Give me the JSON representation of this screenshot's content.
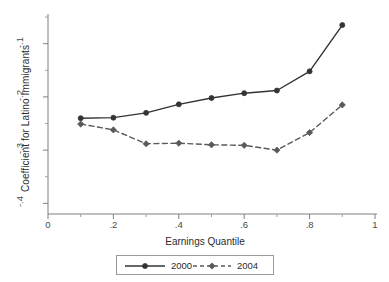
{
  "chart_data": {
    "type": "line",
    "title": "",
    "xlabel": "Earnings Quantile",
    "ylabel": "Coefficient for Latino Immigrants",
    "xlim": [
      0,
      1
    ],
    "ylim": [
      -0.42,
      -0.048
    ],
    "grid": false,
    "legend_position": "bottom-outside",
    "x": [
      0.1,
      0.2,
      0.3,
      0.4,
      0.5,
      0.6,
      0.7,
      0.8,
      0.9
    ],
    "xticks": [
      "0",
      ".2",
      ".4",
      ".6",
      ".8",
      "1"
    ],
    "xtick_values": [
      0,
      0.2,
      0.4,
      0.6,
      0.8,
      1
    ],
    "xminor_values": [
      0.1,
      0.3,
      0.5,
      0.7,
      0.9
    ],
    "yticks": [
      "-.1",
      "-.2",
      "-.3",
      "-.4"
    ],
    "ytick_values": [
      -0.1,
      -0.2,
      -0.3,
      -0.4
    ],
    "series": [
      {
        "name": "2000",
        "linestyle": "solid",
        "marker": "circle",
        "color": "#333333",
        "values": [
          -0.24,
          -0.239,
          -0.23,
          -0.214,
          -0.202,
          -0.193,
          -0.188,
          -0.152,
          -0.065
        ]
      },
      {
        "name": "2004",
        "linestyle": "dashed",
        "marker": "diamond",
        "color": "#5a5a5a",
        "values": [
          -0.251,
          -0.262,
          -0.288,
          -0.287,
          -0.29,
          -0.291,
          -0.3,
          -0.267,
          -0.215
        ]
      }
    ]
  },
  "legend": {
    "items": [
      {
        "label": "2000"
      },
      {
        "label": "2004"
      }
    ]
  },
  "axes": {
    "y_title": "Coefficient for Latino Immigrants",
    "x_title": "Earnings Quantile",
    "y_tick_labels": [
      "-.1",
      "-.2",
      "-.3",
      "-.4"
    ],
    "x_tick_labels": [
      "0",
      ".2",
      ".4",
      ".6",
      ".8",
      "1"
    ]
  }
}
